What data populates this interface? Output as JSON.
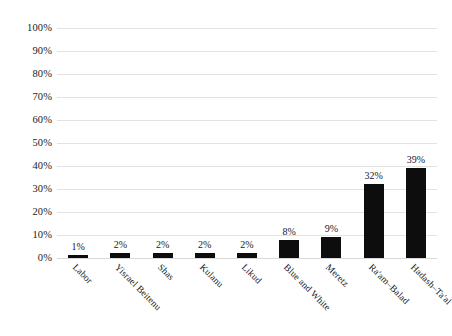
{
  "chart_data": {
    "type": "bar",
    "title": "",
    "subtitle": "",
    "xlabel": "",
    "ylabel": "",
    "categories": [
      "Labor",
      "Yisrael Beitenu",
      "Shas",
      "Kulanu",
      "Likud",
      "Blue and White",
      "Meretz",
      "Ra'am–Balad",
      "Hadash–Ta'al"
    ],
    "values": [
      1,
      2,
      2,
      2,
      2,
      8,
      9,
      32,
      39
    ],
    "data_labels": [
      "1%",
      "2%",
      "2%",
      "2%",
      "2%",
      "8%",
      "9%",
      "32%",
      "39%"
    ],
    "ylim": [
      0,
      100
    ],
    "ytick_values": [
      0,
      10,
      20,
      30,
      40,
      50,
      60,
      70,
      80,
      90,
      100
    ],
    "ytick_labels": [
      "100%",
      "90%",
      "80%",
      "70%",
      "60%",
      "50%",
      "40%",
      "30%",
      "20%",
      "10%",
      "0%"
    ],
    "grid": true,
    "legend": false,
    "legend_position": "none",
    "series": [
      {
        "name": "Share",
        "values": [
          1,
          2,
          2,
          2,
          2,
          8,
          9,
          32,
          39
        ]
      }
    ],
    "colors": {
      "bar": "#0d0d0d",
      "gridline": "#e2e2e2",
      "text": "#1a1a1a",
      "background": "#ffffff"
    }
  }
}
